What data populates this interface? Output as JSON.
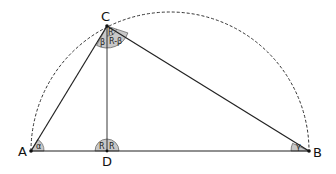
{
  "diagram": {
    "type": "geometry",
    "vertices": {
      "A": {
        "label": "A",
        "x": 31,
        "y": 151
      },
      "B": {
        "label": "B",
        "x": 309,
        "y": 151
      },
      "C": {
        "label": "C",
        "x": 107,
        "y": 26
      },
      "D": {
        "label": "D",
        "x": 107,
        "y": 151
      }
    },
    "angles": {
      "alpha": {
        "label": "α",
        "at": "A"
      },
      "gamma": {
        "label": "γ",
        "at": "B"
      },
      "beta": {
        "label": "β",
        "at": "C"
      },
      "c_top": {
        "label": "R",
        "at": "C"
      },
      "r_minus_beta": {
        "label": "R-β",
        "at": "C"
      },
      "d_left": {
        "label": "R",
        "at": "D"
      },
      "d_right": {
        "label": "R",
        "at": "D"
      }
    },
    "colors": {
      "stroke": "#222222",
      "angle_fill": "#c8c8c8",
      "dashed": "#333333"
    }
  }
}
